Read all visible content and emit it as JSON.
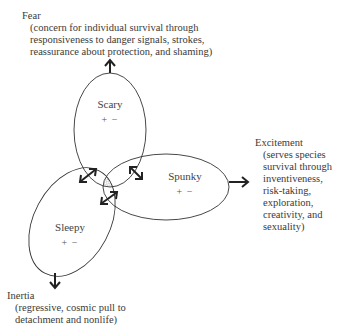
{
  "diagram": {
    "nodes": [
      {
        "id": "scary",
        "name": "Scary",
        "signs": "+ −"
      },
      {
        "id": "spunky",
        "name": "Spunky",
        "signs": "+ −"
      },
      {
        "id": "sleepy",
        "name": "Sleepy",
        "signs": "+ −"
      }
    ],
    "outcomes": {
      "fear": {
        "title": "Fear",
        "lines": [
          "(concern for individual survival through",
          "responsiveness to danger signals, strokes,",
          "reassurance about protection, and shaming)"
        ]
      },
      "excitement": {
        "title": "Excitement",
        "lines": [
          "(serves species",
          "survival through",
          "inventiveness,",
          "risk-taking,",
          "exploration,",
          "creativity, and",
          "sexuality)"
        ]
      },
      "inertia": {
        "title": "Inertia",
        "lines": [
          "(regressive, cosmic pull to",
          "detachment and nonlife)"
        ]
      }
    },
    "colors": {
      "stroke": "#333333",
      "text": "#3a3a3a",
      "hatch": "#888888"
    }
  }
}
